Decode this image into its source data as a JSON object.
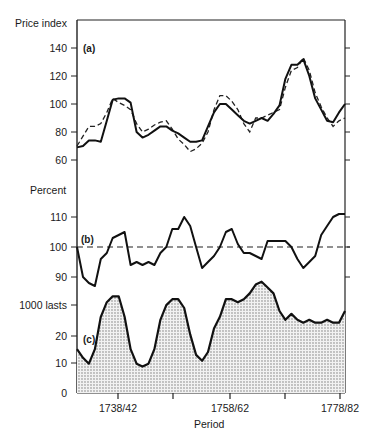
{
  "chart_data": [
    {
      "panel": "(a)",
      "type": "line",
      "ylabel": "Price index",
      "yticks": [
        60,
        80,
        100,
        120,
        140
      ],
      "ylim": [
        60,
        150
      ],
      "x": [
        1735,
        1736,
        1737,
        1738,
        1739,
        1740,
        1741,
        1742,
        1743,
        1744,
        1745,
        1746,
        1747,
        1748,
        1749,
        1750,
        1751,
        1752,
        1753,
        1754,
        1755,
        1756,
        1757,
        1758,
        1759,
        1760,
        1761,
        1762,
        1763,
        1764,
        1765,
        1766,
        1767,
        1768,
        1769,
        1770,
        1771,
        1772,
        1773,
        1774,
        1775,
        1776,
        1777,
        1778,
        1779,
        1780
      ],
      "series": [
        {
          "name": "solid",
          "style": "solid",
          "values": [
            69,
            70,
            74,
            74,
            73,
            88,
            103,
            104,
            104,
            101,
            80,
            76,
            78,
            81,
            84,
            84,
            81,
            79,
            76,
            73,
            73,
            74,
            84,
            94,
            100,
            100,
            96,
            92,
            88,
            86,
            88,
            90,
            88,
            93,
            99,
            118,
            128,
            128,
            132,
            120,
            104,
            96,
            88,
            87,
            94,
            100
          ]
        },
        {
          "name": "dashed",
          "style": "dashed",
          "values": [
            70,
            77,
            84,
            84,
            86,
            94,
            104,
            101,
            99,
            96,
            86,
            80,
            82,
            85,
            87,
            88,
            82,
            75,
            71,
            66,
            68,
            72,
            80,
            96,
            106,
            106,
            102,
            96,
            86,
            80,
            90,
            90,
            92,
            94,
            96,
            112,
            124,
            126,
            133,
            124,
            108,
            98,
            90,
            84,
            88,
            90
          ]
        }
      ]
    },
    {
      "panel": "(b)",
      "type": "line",
      "ylabel": "Percent",
      "yticks": [
        90,
        100,
        110
      ],
      "ylim": [
        84,
        114
      ],
      "x": [
        1735,
        1736,
        1737,
        1738,
        1739,
        1740,
        1741,
        1742,
        1743,
        1744,
        1745,
        1746,
        1747,
        1748,
        1749,
        1750,
        1751,
        1752,
        1753,
        1754,
        1755,
        1756,
        1757,
        1758,
        1759,
        1760,
        1761,
        1762,
        1763,
        1764,
        1765,
        1766,
        1767,
        1768,
        1769,
        1770,
        1771,
        1772,
        1773,
        1774,
        1775,
        1776,
        1777,
        1778,
        1779,
        1780
      ],
      "series": [
        {
          "name": "solid",
          "style": "solid",
          "values": [
            100,
            90,
            88,
            87,
            96,
            98,
            103,
            104,
            105,
            94,
            95,
            94,
            95,
            94,
            98,
            100,
            106,
            106,
            110,
            107,
            100,
            93,
            95,
            97,
            100,
            105,
            106,
            101,
            98,
            98,
            97,
            96,
            102,
            102,
            102,
            102,
            100,
            96,
            93,
            95,
            97,
            104,
            107,
            110,
            111,
            111
          ]
        },
        {
          "name": "reference",
          "style": "dashed",
          "values": [
            100,
            100
          ]
        }
      ]
    },
    {
      "panel": "(c)",
      "type": "area",
      "ylabel": "1000 lasts",
      "yticks": [
        0,
        10,
        20,
        30
      ],
      "ytick_labels": [
        "0",
        "10",
        "20",
        "1000 lasts"
      ],
      "ylim": [
        0,
        38
      ],
      "xlabel": "Period",
      "xtick_labels": [
        "1738/42",
        "",
        "1758/62",
        "",
        "1778/82"
      ],
      "x": [
        1735,
        1736,
        1737,
        1738,
        1739,
        1740,
        1741,
        1742,
        1743,
        1744,
        1745,
        1746,
        1747,
        1748,
        1749,
        1750,
        1751,
        1752,
        1753,
        1754,
        1755,
        1756,
        1757,
        1758,
        1759,
        1760,
        1761,
        1762,
        1763,
        1764,
        1765,
        1766,
        1767,
        1768,
        1769,
        1770,
        1771,
        1772,
        1773,
        1774,
        1775,
        1776,
        1777,
        1778,
        1779,
        1780
      ],
      "series": [
        {
          "name": "shaded",
          "style": "solid-fill-dotted",
          "values": [
            15,
            12,
            10,
            15,
            26,
            31,
            33,
            33,
            26,
            15,
            10,
            9,
            10,
            15,
            25,
            30,
            32,
            32,
            29,
            20,
            13,
            11,
            14,
            22,
            26,
            32,
            32,
            31,
            32,
            34,
            37,
            38,
            36,
            34,
            28,
            25,
            27,
            25,
            24,
            25,
            24,
            24,
            25,
            24,
            24,
            28
          ]
        }
      ]
    }
  ],
  "labels": {
    "a_ylabel": "Price index",
    "b_ylabel": "Percent",
    "c_ylabel": "1000 lasts",
    "panel_a": "(a)",
    "panel_b": "(b)",
    "panel_c": "(c)",
    "xlabel": "Period",
    "a_ticks": [
      "140",
      "120",
      "100",
      "80",
      "60"
    ],
    "b_ticks": [
      "110",
      "100",
      "90"
    ],
    "c_ticks": [
      "20",
      "10",
      "0"
    ],
    "x_ticks": [
      "1738/42",
      "1758/62",
      "1778/82"
    ]
  }
}
